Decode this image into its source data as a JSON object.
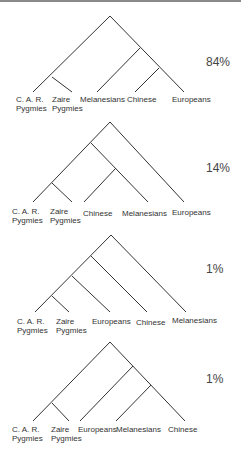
{
  "figure": {
    "trees": [
      {
        "percent": "84%",
        "leaves": [
          "C. A. R.\nPygmies",
          "Zaire\nPygmies",
          "Melanesians",
          "Chinese",
          "Europeans"
        ],
        "topology": "((CAR,Zaire),(Melanesians,(Chinese,Europeans)))"
      },
      {
        "percent": "14%",
        "leaves": [
          "C. A. R.\nPygmies",
          "Zaire\nPygmies",
          "Chinese",
          "Melanesians",
          "Europeans"
        ],
        "topology": "(((CAR,Zaire),(Chinese,Melanesians)),Europeans)"
      },
      {
        "percent": "1%",
        "leaves": [
          "C. A. R.\nPygmies",
          "Zaire\nPygmies",
          "Europeans",
          "Chinese",
          "Melanesians"
        ],
        "topology": "((((CAR,Zaire),Europeans),Chinese),Melanesians)"
      },
      {
        "percent": "1%",
        "leaves": [
          "C. A. R.\nPygmies",
          "Zaire\nPygmies",
          "Europeans",
          "Melanesians",
          "Chinese"
        ],
        "topology": "((CAR,Zaire),(Europeans,(Melanesians,Chinese)))"
      }
    ],
    "labels": {
      "t0": {
        "l0a": "C. A. R.",
        "l0b": "Pygmies",
        "l1a": "Zaire",
        "l1b": "Pygmies",
        "l2": "Melanesians",
        "l3": "Chinese",
        "l4": "Europeans",
        "pct": "84%"
      },
      "t1": {
        "l0a": "C. A. R.",
        "l0b": "Pygmies",
        "l1a": "Zaire",
        "l1b": "Pygmies",
        "l2": "Chinese",
        "l3": "Melanesians",
        "l4": "Europeans",
        "pct": "14%"
      },
      "t2": {
        "l0a": "C. A. R.",
        "l0b": "Pygmies",
        "l1a": "Zaire",
        "l1b": "Pygmies",
        "l2": "Europeans",
        "l3": "Chinese",
        "l4": "Melanesians",
        "pct": "1%"
      },
      "t3": {
        "l0a": "C. A. R.",
        "l0b": "Pygmies",
        "l1a": "Zaire",
        "l1b": "Pygmies",
        "l2": "Europeans",
        "l3": "Melanesians",
        "l4": "Chinese",
        "pct": "1%"
      }
    }
  }
}
